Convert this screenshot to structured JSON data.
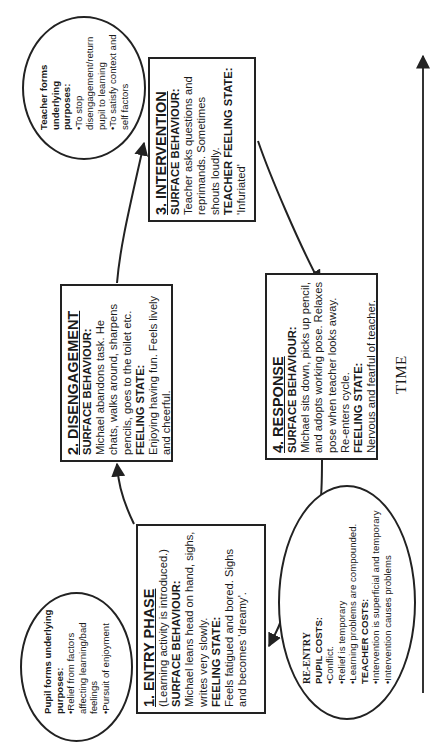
{
  "diagram": {
    "orientation": "rotated-90-ccw",
    "time_axis": {
      "label": "TIME",
      "direction": "left-to-right in reading orientation"
    },
    "boxes": [
      {
        "id": "entry",
        "title": "1. ENTRY PHASE",
        "subtitle": "(Learning activity is introduced.)",
        "surface_label": "SURFACE BEHAVIOUR:",
        "surface_text": "Michael leans head on hand, sighs, writes very slowly.",
        "feeling_label": "FEELING STATE:",
        "feeling_text": "Feels fatigued and bored. Sighs and becomes 'dreamy'."
      },
      {
        "id": "disengagement",
        "title": "2. DISENGAGEMENT",
        "surface_label": "SURFACE BEHAVIOUR:",
        "surface_text": "Michael abandons task. He chats, walks around, sharpens pencils, goes to the toilet etc.",
        "feeling_label": "FEELING STATE:",
        "feeling_text": "Enjoying having fun. Feels lively and cheerful."
      },
      {
        "id": "intervention",
        "title": "3. INTERVENTION",
        "surface_label": "SURFACE BEHAVIOUR:",
        "surface_text": "Teacher asks questions and reprimands. Sometimes shouts loudly.",
        "feeling_label": "TEACHER FEELING STATE:",
        "feeling_text": "'Infuriated'"
      },
      {
        "id": "response",
        "title": "4. RESPONSE",
        "surface_label": "SURFACE BEHAVIOUR:",
        "surface_text": "Michael sits down, picks up pencil, and adopts working pose. Relaxes pose when teacher looks away. Re-enters cycle.",
        "feeling_label": "FEELING STATE:",
        "feeling_text": "Nervous and fearful of teacher."
      }
    ],
    "ellipses": {
      "pupil": {
        "heading": "Pupil forms underlying purposes:",
        "items": [
          "•Relief from factors affecting learning/bad feelings",
          "•Pursuit of enjoyment"
        ]
      },
      "teacher": {
        "heading": "Teacher forms underlying purposes:",
        "items": [
          "•To stop disengagement/return pupil to learning",
          "•To satisfy context and self factors"
        ]
      },
      "reentry": {
        "title": "RE-ENTRY",
        "pupil_costs_label": "PUPIL COSTS:",
        "pupil_costs": [
          "•Conflict.",
          "•Relief is temporary",
          "•Learning problems are compounded."
        ],
        "teacher_costs_label": "TEACHER COSTS:",
        "teacher_costs": [
          "•Intervention is superficial and temporary",
          "•Intervention causes problems"
        ]
      }
    },
    "colors": {
      "stroke": "#222222",
      "background": "#ffffff",
      "text": "#1a1a1a"
    }
  }
}
